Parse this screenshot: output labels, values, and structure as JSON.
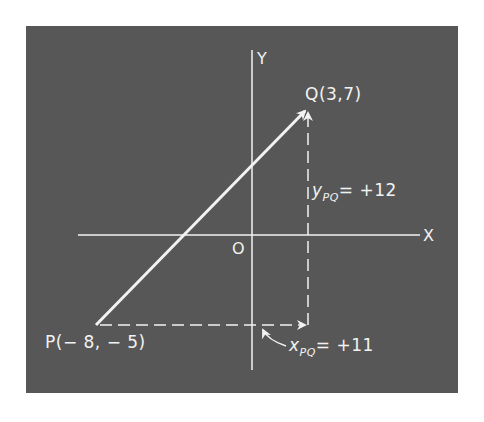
{
  "diagram": {
    "background_color": "#575757",
    "line_color": "#f2f2f2",
    "axes": {
      "x_label": "X",
      "y_label": "Y",
      "origin_label": "O"
    },
    "points": {
      "P": {
        "label": "P(− 8, − 5)",
        "x": -8,
        "y": -5
      },
      "Q": {
        "label": "Q(3,7)",
        "x": 3,
        "y": 7
      }
    },
    "vector": {
      "from": "P",
      "to": "Q"
    },
    "components": {
      "x": {
        "symbol": "x",
        "subscript": "PQ",
        "value_text": "= +11",
        "value": 11
      },
      "y": {
        "symbol": "y",
        "subscript": "PQ",
        "value_text": "= +12",
        "value": 12
      }
    }
  }
}
